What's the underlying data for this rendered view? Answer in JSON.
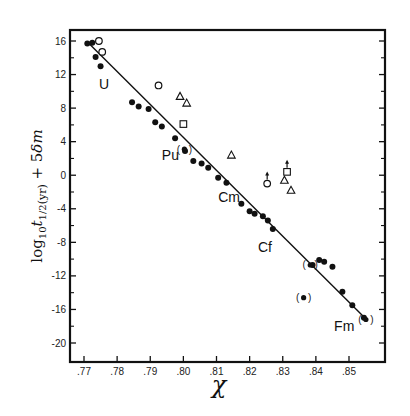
{
  "chart_data": {
    "type": "scatter",
    "title": "",
    "xlabel": "χ",
    "ylabel": "log10 t1/2(yr) + 5δm",
    "xlim": [
      0.765,
      0.859
    ],
    "ylim": [
      -21.5,
      17.5
    ],
    "grid": false,
    "legend": null,
    "x_ticks": [
      ".77",
      ".78",
      ".79",
      ".80",
      ".81",
      ".82",
      ".83",
      ".84",
      ".85"
    ],
    "x_tick_values": [
      0.77,
      0.78,
      0.79,
      0.8,
      0.81,
      0.82,
      0.83,
      0.84,
      0.85
    ],
    "y_ticks": [
      "16",
      "12",
      "8",
      "4",
      "0",
      "-4",
      "-8",
      "-12",
      "-16",
      "-20"
    ],
    "y_tick_values": [
      16,
      12,
      8,
      4,
      0,
      -4,
      -8,
      -12,
      -16,
      -20
    ],
    "fit_line": {
      "x0": 0.7715,
      "y0": 15.7,
      "x1": 0.8555,
      "y1": -17.3
    },
    "annotations": [
      {
        "text": "U",
        "x": 0.7745,
        "y": 10.3
      },
      {
        "text": "Pu",
        "x": 0.7935,
        "y": 1.8
      },
      {
        "text": "Cm",
        "x": 0.8105,
        "y": -3.2
      },
      {
        "text": "Cf",
        "x": 0.8225,
        "y": -9.2
      },
      {
        "text": "Fm",
        "x": 0.8455,
        "y": -18.6
      }
    ],
    "series": [
      {
        "name": "filled circles (even-even)",
        "marker": "filled-circle",
        "points": [
          [
            0.771,
            15.7
          ],
          [
            0.7725,
            15.8
          ],
          [
            0.7735,
            14.1
          ],
          [
            0.775,
            13.0
          ],
          [
            0.7845,
            8.7
          ],
          [
            0.7865,
            8.2
          ],
          [
            0.7895,
            7.9
          ],
          [
            0.7915,
            6.3
          ],
          [
            0.7935,
            5.8
          ],
          [
            0.7975,
            4.4
          ],
          [
            0.8005,
            2.9
          ],
          [
            0.803,
            1.7
          ],
          [
            0.8055,
            1.4
          ],
          [
            0.8075,
            0.9
          ],
          [
            0.8105,
            -0.3
          ],
          [
            0.813,
            -0.9
          ],
          [
            0.8175,
            -3.4
          ],
          [
            0.82,
            -4.3
          ],
          [
            0.8215,
            -4.6
          ],
          [
            0.824,
            -4.9
          ],
          [
            0.8255,
            -5.4
          ],
          [
            0.827,
            -6.4
          ],
          [
            0.839,
            -10.7
          ],
          [
            0.841,
            -10.1
          ],
          [
            0.8425,
            -10.3
          ],
          [
            0.845,
            -10.9
          ],
          [
            0.848,
            -13.9
          ],
          [
            0.851,
            -15.5
          ],
          [
            0.8545,
            -17.0
          ]
        ]
      },
      {
        "name": "parenthesized filled circles",
        "marker": "paren-circle",
        "points": [
          [
            0.8003,
            3.1
          ],
          [
            0.8383,
            -10.7
          ],
          [
            0.8363,
            -14.6
          ],
          [
            0.8551,
            -17.2
          ]
        ]
      },
      {
        "name": "open circles",
        "marker": "open-circle",
        "points": [
          [
            0.7745,
            16.0
          ],
          [
            0.7755,
            14.7
          ],
          [
            0.7925,
            10.7
          ],
          [
            0.8253,
            -1.0
          ]
        ]
      },
      {
        "name": "open triangles",
        "marker": "open-triangle",
        "points": [
          [
            0.799,
            9.4
          ],
          [
            0.801,
            8.6
          ],
          [
            0.8145,
            2.4
          ],
          [
            0.8305,
            -0.6
          ],
          [
            0.8325,
            -1.8
          ]
        ]
      },
      {
        "name": "open squares",
        "marker": "open-square",
        "points": [
          [
            0.8,
            6.1
          ],
          [
            0.8313,
            0.4
          ]
        ]
      }
    ],
    "upward_arrows": [
      [
        0.8253,
        -1.0
      ],
      [
        0.8313,
        0.4
      ]
    ]
  }
}
